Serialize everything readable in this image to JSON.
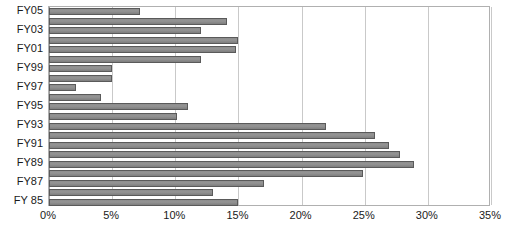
{
  "chart_data": {
    "type": "bar",
    "orientation": "horizontal",
    "title": "",
    "xlabel": "",
    "ylabel": "",
    "xlim": [
      0,
      35
    ],
    "ylim": null,
    "grid": true,
    "legend": false,
    "value_suffix": "%",
    "xticks": [
      0,
      5,
      10,
      15,
      20,
      25,
      30,
      35
    ],
    "xticklabels": [
      "0%",
      "5%",
      "10%",
      "15%",
      "20%",
      "25%",
      "30%",
      "35%"
    ],
    "categories": [
      "FY05",
      "FY04",
      "FY03",
      "FY02",
      "FY01",
      "FY00",
      "FY99",
      "FY98",
      "FY97",
      "FY96",
      "FY95",
      "FY94",
      "FY93",
      "FY92",
      "FY91",
      "FY90",
      "FY89",
      "FY88",
      "FY87",
      "FY86",
      "FY 85"
    ],
    "yticklabels": [
      "FY05",
      "",
      "FY03",
      "",
      "FY01",
      "",
      "FY99",
      "",
      "FY97",
      "",
      "FY95",
      "",
      "FY93",
      "",
      "FY91",
      "",
      "FY89",
      "",
      "FY87",
      "",
      "FY 85"
    ],
    "values": [
      7.2,
      14.1,
      12.0,
      15.0,
      14.8,
      12.0,
      5.0,
      5.0,
      2.1,
      4.1,
      11.0,
      10.1,
      21.9,
      25.8,
      26.9,
      27.8,
      28.9,
      24.9,
      17.0,
      13.0,
      15.0
    ],
    "colors": {
      "bar_fill": "#8d8d8d",
      "bar_border": "#5a5a5a",
      "gridline": "#c9c9c9",
      "axis_line": "#b0b0b0",
      "plot_background": "#ffffff",
      "text": "#1a1a1a"
    }
  }
}
